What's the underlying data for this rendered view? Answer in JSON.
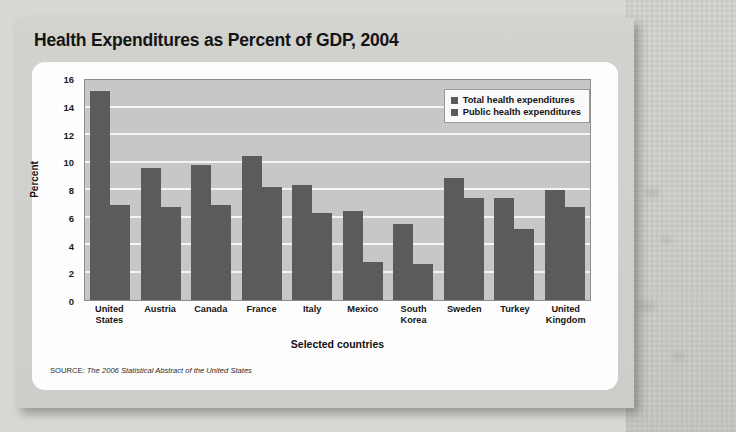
{
  "chart_data": {
    "type": "bar",
    "title": "Health Expenditures as Percent of GDP, 2004",
    "xlabel": "Selected countries",
    "ylabel": "Percent",
    "ylim": [
      0,
      16
    ],
    "yticks": [
      16,
      14,
      12,
      10,
      8,
      6,
      4,
      2,
      0
    ],
    "grid": true,
    "legend_position": "top-right",
    "categories": [
      "United States",
      "Austria",
      "Canada",
      "France",
      "Italy",
      "Mexico",
      "South Korea",
      "Sweden",
      "Turkey",
      "United Kingdom"
    ],
    "series": [
      {
        "name": "Total health expenditures",
        "color": "#5b5b5b",
        "values": [
          15.2,
          9.6,
          9.8,
          10.5,
          8.4,
          6.5,
          5.5,
          8.9,
          7.4,
          8.0
        ]
      },
      {
        "name": "Public health expenditures",
        "color": "#5b5b5b",
        "values": [
          6.9,
          6.8,
          6.9,
          8.2,
          6.3,
          2.8,
          2.6,
          7.4,
          5.2,
          6.8
        ]
      }
    ],
    "source_label": "SOURCE:",
    "source_text": "The 2006 Statistical Abstract of the United States"
  },
  "category_lines": [
    [
      "United",
      "States"
    ],
    [
      "Austria"
    ],
    [
      "Canada"
    ],
    [
      "France"
    ],
    [
      "Italy"
    ],
    [
      "Mexico"
    ],
    [
      "South",
      "Korea"
    ],
    [
      "Sweden"
    ],
    [
      "Turkey"
    ],
    [
      "United",
      "Kingdom"
    ]
  ]
}
